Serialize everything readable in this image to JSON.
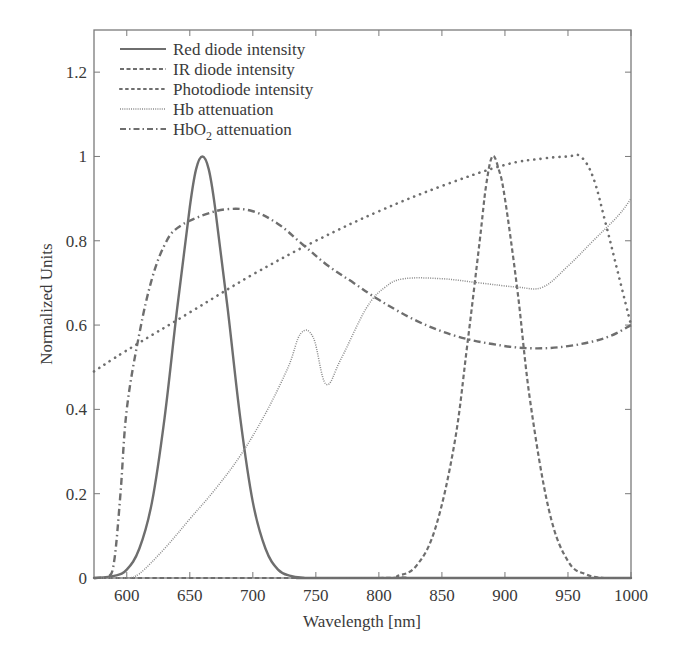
{
  "chart_data": {
    "type": "line",
    "title": "",
    "xlabel": "Wavelength [nm]",
    "ylabel": "Normalized Units",
    "xlim": [
      574,
      1000
    ],
    "ylim": [
      0,
      1.3
    ],
    "grid": false,
    "legend_position": "upper-left",
    "x_ticks": [
      600,
      650,
      700,
      750,
      800,
      850,
      900,
      950,
      1000
    ],
    "x_tick_labels": [
      "600",
      "650",
      "700",
      "750",
      "800",
      "850",
      "900",
      "950",
      "1000"
    ],
    "y_ticks": [
      0,
      0.2,
      0.4,
      0.6,
      0.8,
      1,
      1.2
    ],
    "y_tick_labels": [
      "0",
      "0.2",
      "0.4",
      "0.6",
      "0.8",
      "1",
      "1.2"
    ],
    "series": [
      {
        "name": "Red diode intensity",
        "style": "solid",
        "x": [
          574,
          590,
          600,
          610,
          620,
          630,
          640,
          650,
          655,
          660,
          665,
          670,
          680,
          690,
          700,
          710,
          720,
          730,
          740,
          760,
          1000
        ],
        "y": [
          0,
          0.005,
          0.02,
          0.07,
          0.18,
          0.38,
          0.64,
          0.88,
          0.97,
          1.0,
          0.97,
          0.88,
          0.64,
          0.38,
          0.18,
          0.07,
          0.02,
          0.005,
          0.001,
          0,
          0
        ]
      },
      {
        "name": "IR diode intensity",
        "style": "dashed",
        "x": [
          574,
          800,
          815,
          830,
          845,
          860,
          870,
          880,
          885,
          890,
          895,
          900,
          910,
          920,
          935,
          950,
          965,
          980,
          1000
        ],
        "y": [
          0,
          0,
          0.005,
          0.03,
          0.12,
          0.32,
          0.55,
          0.8,
          0.93,
          1.0,
          0.97,
          0.9,
          0.68,
          0.42,
          0.16,
          0.04,
          0.008,
          0,
          0
        ]
      },
      {
        "name": "Photodiode intensity",
        "style": "dotted",
        "x": [
          574,
          600,
          650,
          700,
          750,
          800,
          850,
          900,
          930,
          950,
          960,
          970,
          980,
          990,
          1000
        ],
        "y": [
          0.49,
          0.54,
          0.63,
          0.72,
          0.8,
          0.87,
          0.93,
          0.98,
          0.995,
          1.0,
          1.0,
          0.95,
          0.84,
          0.72,
          0.6
        ]
      },
      {
        "name": "Hb attenuation",
        "style": "fine-dotted",
        "x": [
          574,
          600,
          610,
          630,
          650,
          670,
          690,
          710,
          728,
          738,
          748,
          758,
          770,
          790,
          805,
          820,
          850,
          880,
          910,
          930,
          950,
          970,
          990,
          1000
        ],
        "y": [
          0,
          0,
          0.01,
          0.07,
          0.14,
          0.21,
          0.29,
          0.39,
          0.5,
          0.58,
          0.57,
          0.46,
          0.52,
          0.64,
          0.69,
          0.71,
          0.71,
          0.7,
          0.69,
          0.69,
          0.74,
          0.8,
          0.86,
          0.9
        ]
      },
      {
        "name": "HbO2 attenuation",
        "style": "dash-dot",
        "x": [
          574,
          585,
          590,
          595,
          600,
          610,
          620,
          630,
          640,
          660,
          680,
          700,
          720,
          740,
          760,
          780,
          800,
          830,
          860,
          890,
          920,
          950,
          980,
          1000
        ],
        "y": [
          0,
          0.002,
          0.04,
          0.2,
          0.4,
          0.58,
          0.71,
          0.79,
          0.83,
          0.86,
          0.875,
          0.87,
          0.84,
          0.79,
          0.74,
          0.7,
          0.66,
          0.61,
          0.575,
          0.555,
          0.545,
          0.55,
          0.57,
          0.6
        ]
      }
    ]
  },
  "legend": [
    {
      "label": "Red diode intensity"
    },
    {
      "label": "IR diode intensity"
    },
    {
      "label": "Photodiode intensity"
    },
    {
      "label": "Hb attenuation"
    },
    {
      "label_main": "HbO",
      "label_sub": "2",
      "label_rest": " attenuation"
    }
  ],
  "axes": {
    "xlabel": "Wavelength [nm]",
    "ylabel": "Normalized Units"
  },
  "colors": {
    "line": "#6e6e6e",
    "frame": "#7a7a7a",
    "text": "#3a3a3a"
  }
}
